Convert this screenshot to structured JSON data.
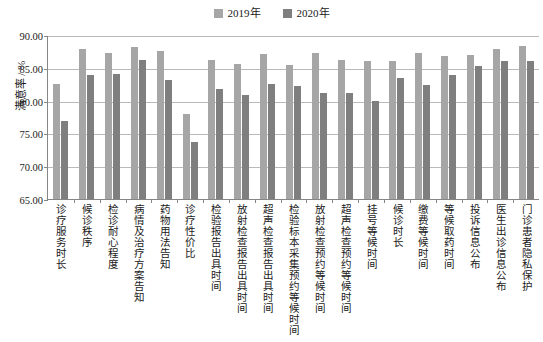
{
  "chart_data": {
    "type": "bar",
    "title": "",
    "subtitle": "",
    "xlabel": "",
    "ylabel": "满意率 / %",
    "ylim": [
      65.0,
      90.0
    ],
    "yticks": [
      "65.00",
      "70.00",
      "75.00",
      "80.00",
      "85.00",
      "90.00"
    ],
    "ytick_values": [
      65.0,
      70.0,
      75.0,
      80.0,
      85.0,
      90.0
    ],
    "grid": true,
    "legend_position": "top-center",
    "categories": [
      "诊疗服务时长",
      "候诊秩序",
      "检诊耐心程度",
      "病情及治疗方案告知",
      "药物用法告知",
      "诊疗性价比",
      "检验报告出具时间",
      "放射检查报告出具时间",
      "超声检查报告出具时间",
      "检验标本采集预约等候时间",
      "放射检查预约等候时间",
      "超声检查预约等候时间",
      "挂号等候时间",
      "候诊时长",
      "缴费等候时间",
      "等候取药时间",
      "投诉信息公布",
      "医生出诊信息公布",
      "门诊患者隐私保护"
    ],
    "series": [
      {
        "name": "2019年",
        "color": "#a6a6a6",
        "values": [
          82.6,
          87.9,
          87.3,
          88.2,
          87.6,
          78.0,
          86.2,
          85.6,
          87.1,
          85.5,
          87.3,
          86.2,
          86.0,
          86.1,
          87.2,
          86.8,
          87.0,
          87.8,
          88.3
        ]
      },
      {
        "name": "2020年",
        "color": "#7f7f7f",
        "values": [
          76.9,
          83.9,
          84.0,
          86.2,
          83.2,
          73.7,
          81.7,
          80.9,
          82.6,
          82.2,
          81.2,
          81.1,
          80.0,
          83.5,
          82.4,
          83.9,
          85.3,
          86.1,
          86.0
        ]
      }
    ]
  },
  "legend": {
    "entries": [
      {
        "label": "2019年",
        "color": "#a6a6a6"
      },
      {
        "label": "2020年",
        "color": "#7f7f7f"
      }
    ]
  },
  "axes": {
    "y_title": "满意率 / %"
  }
}
